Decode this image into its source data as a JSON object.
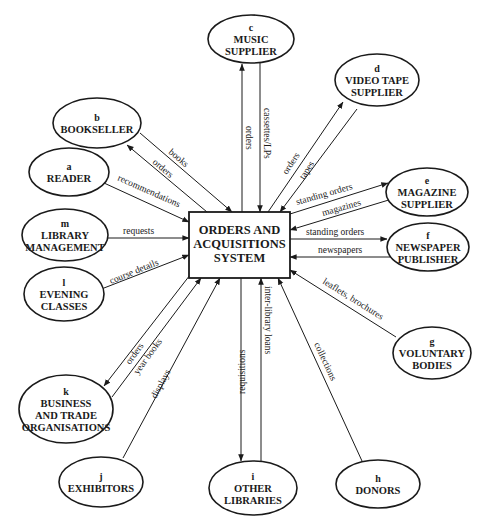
{
  "colors": {
    "ink": "#1a1a1a",
    "background": "#ffffff"
  },
  "center": {
    "lines": [
      "ORDERS AND",
      "ACQUISITIONS",
      "SYSTEM"
    ],
    "box": {
      "x": 189,
      "y": 212,
      "w": 101,
      "h": 66
    }
  },
  "nodes": [
    {
      "id": "a",
      "letter": "a",
      "lines": [
        "READER"
      ],
      "cx": 69,
      "cy": 172,
      "rx": 40,
      "ry": 24
    },
    {
      "id": "b",
      "letter": "b",
      "lines": [
        "BOOKSELLER"
      ],
      "cx": 97,
      "cy": 123,
      "rx": 44,
      "ry": 25
    },
    {
      "id": "c",
      "letter": "c",
      "lines": [
        "MUSIC",
        "SUPPLIER"
      ],
      "cx": 251,
      "cy": 39,
      "rx": 43,
      "ry": 24
    },
    {
      "id": "d",
      "letter": "d",
      "lines": [
        "VIDEO TAPE",
        "SUPPLIER"
      ],
      "cx": 377,
      "cy": 80,
      "rx": 42,
      "ry": 26
    },
    {
      "id": "e",
      "letter": "e",
      "lines": [
        "MAGAZINE",
        "SUPPLIER"
      ],
      "cx": 427,
      "cy": 192,
      "rx": 41,
      "ry": 24
    },
    {
      "id": "f",
      "letter": "f",
      "lines": [
        "NEWSPAPER",
        "PUBLISHER"
      ],
      "cx": 428,
      "cy": 247,
      "rx": 41,
      "ry": 24
    },
    {
      "id": "g",
      "letter": "g",
      "lines": [
        "VOLUNTARY",
        "BODIES"
      ],
      "cx": 432,
      "cy": 353,
      "rx": 39,
      "ry": 26
    },
    {
      "id": "h",
      "letter": "h",
      "lines": [
        "DONORS"
      ],
      "cx": 378,
      "cy": 484,
      "rx": 42,
      "ry": 24
    },
    {
      "id": "i",
      "letter": "i",
      "lines": [
        "OTHER",
        "LIBRARIES"
      ],
      "cx": 253,
      "cy": 488,
      "rx": 44,
      "ry": 27
    },
    {
      "id": "j",
      "letter": "j",
      "lines": [
        "EXHIBITORS"
      ],
      "cx": 101,
      "cy": 482,
      "rx": 42,
      "ry": 25
    },
    {
      "id": "k",
      "letter": "k",
      "lines": [
        "BUSINESS",
        "AND TRADE",
        "ORGANISATIONS"
      ],
      "cx": 66,
      "cy": 409,
      "rx": 47,
      "ry": 34
    },
    {
      "id": "l",
      "letter": "l",
      "lines": [
        "EVENING",
        "CLASSES"
      ],
      "cx": 64,
      "cy": 294,
      "rx": 40,
      "ry": 27
    },
    {
      "id": "m",
      "letter": "m",
      "lines": [
        "LIBRARY",
        "MANAGEMENT"
      ],
      "cx": 65,
      "cy": 235,
      "rx": 43,
      "ry": 26
    }
  ],
  "flows": [
    {
      "label": "books",
      "from": "b",
      "to": "center",
      "x1": 140,
      "y1": 133,
      "x2": 232,
      "y2": 212,
      "lx": 168,
      "ly": 153,
      "angle": 40
    },
    {
      "label": "orders",
      "from": "center",
      "to": "b",
      "x1": 207,
      "y1": 212,
      "x2": 127,
      "y2": 145,
      "lx": 152,
      "ly": 163,
      "angle": 40
    },
    {
      "label": "recommendations",
      "from": "a",
      "to": "center",
      "x1": 104,
      "y1": 183,
      "x2": 189,
      "y2": 222,
      "lx": 117,
      "ly": 180,
      "angle": 24
    },
    {
      "label": "orders",
      "from": "center",
      "to": "c",
      "x1": 242,
      "y1": 212,
      "x2": 242,
      "y2": 64,
      "lx": 246,
      "ly": 126,
      "angle": 90
    },
    {
      "label": "cassettes/LPs",
      "from": "c",
      "to": "center",
      "x1": 260,
      "y1": 63,
      "x2": 260,
      "y2": 212,
      "lx": 264,
      "ly": 108,
      "angle": 90
    },
    {
      "label": "orders",
      "from": "center",
      "to": "d",
      "x1": 268,
      "y1": 212,
      "x2": 343,
      "y2": 102,
      "lx": 287,
      "ly": 175,
      "angle": -57
    },
    {
      "label": "tapes",
      "from": "d",
      "to": "center",
      "x1": 357,
      "y1": 109,
      "x2": 280,
      "y2": 212,
      "lx": 304,
      "ly": 180,
      "angle": -57
    },
    {
      "label": "standing orders",
      "from": "center",
      "to": "e",
      "x1": 290,
      "y1": 214,
      "x2": 388,
      "y2": 183,
      "lx": 297,
      "ly": 205,
      "angle": -16
    },
    {
      "label": "magazines",
      "from": "e",
      "to": "center",
      "x1": 392,
      "y1": 199,
      "x2": 290,
      "y2": 230,
      "lx": 323,
      "ly": 216,
      "angle": -16
    },
    {
      "label": "standing orders",
      "from": "center",
      "to": "f",
      "x1": 290,
      "y1": 239,
      "x2": 387,
      "y2": 239,
      "lx": 306,
      "ly": 235,
      "angle": 0
    },
    {
      "label": "newspapers",
      "from": "f",
      "to": "center",
      "x1": 390,
      "y1": 257,
      "x2": 290,
      "y2": 257,
      "lx": 318,
      "ly": 253,
      "angle": 0
    },
    {
      "label": "leaflets, brochures",
      "from": "g",
      "to": "center",
      "x1": 396,
      "y1": 337,
      "x2": 290,
      "y2": 270,
      "lx": 322,
      "ly": 283,
      "angle": 32
    },
    {
      "label": "collections",
      "from": "h",
      "to": "center",
      "x1": 362,
      "y1": 461,
      "x2": 278,
      "y2": 278,
      "lx": 314,
      "ly": 344,
      "angle": 65
    },
    {
      "label": "inter-library loans",
      "from": "i",
      "to": "center",
      "x1": 261,
      "y1": 461,
      "x2": 261,
      "y2": 278,
      "lx": 265,
      "ly": 286,
      "angle": 90
    },
    {
      "label": "requisitions",
      "from": "center",
      "to": "i",
      "x1": 241,
      "y1": 278,
      "x2": 241,
      "y2": 461,
      "lx": 245,
      "ly": 394,
      "angle": -90
    },
    {
      "label": "displays",
      "from": "j",
      "to": "center",
      "x1": 123,
      "y1": 458,
      "x2": 220,
      "y2": 278,
      "lx": 156,
      "ly": 399,
      "angle": -62
    },
    {
      "label": "orders",
      "from": "center",
      "to": "k",
      "x1": 190,
      "y1": 275,
      "x2": 104,
      "y2": 386,
      "lx": 130,
      "ly": 365,
      "angle": -54
    },
    {
      "label": "year books",
      "from": "k",
      "to": "center",
      "x1": 112,
      "y1": 397,
      "x2": 201,
      "y2": 278,
      "lx": 138,
      "ly": 375,
      "angle": -54
    },
    {
      "label": "course details",
      "from": "l",
      "to": "center",
      "x1": 104,
      "y1": 288,
      "x2": 189,
      "y2": 255,
      "lx": 111,
      "ly": 284,
      "angle": -22
    },
    {
      "label": "requests",
      "from": "m",
      "to": "center",
      "x1": 108,
      "y1": 238,
      "x2": 189,
      "y2": 238,
      "lx": 123,
      "ly": 234,
      "angle": 0
    }
  ]
}
